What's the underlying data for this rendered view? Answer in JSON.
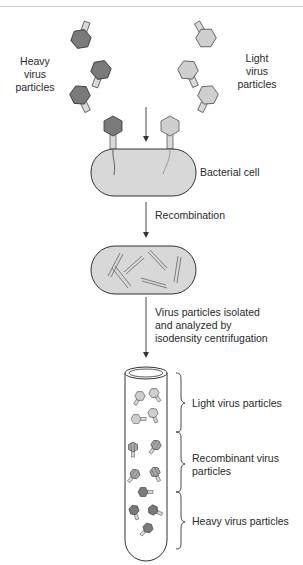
{
  "diagram": {
    "title": "",
    "colors": {
      "heavy": "#7a7a7a",
      "light": "#cfcfcf",
      "tail": "#d9d9d9",
      "cell_fill": "#d8d8d8",
      "outline": "#333333"
    },
    "labels": {
      "heavy_virus": [
        "Heavy",
        "virus",
        "particles"
      ],
      "light_virus": [
        "Light",
        "virus",
        "particles"
      ],
      "bacterial_cell": "Bacterial cell",
      "recombination": "Recombination",
      "isolation": [
        "Virus particles isolated",
        "and analyzed by",
        "isodensity centrifugation"
      ],
      "tube_light": "Light virus particles",
      "tube_recombinant": [
        "Recombinant virus",
        "particles"
      ],
      "tube_heavy": "Heavy virus particles"
    },
    "steps": [
      "Mix heavy and light virus particles",
      "Co-infect bacterial cell",
      "Recombination",
      "Isodensity centrifugation"
    ]
  }
}
